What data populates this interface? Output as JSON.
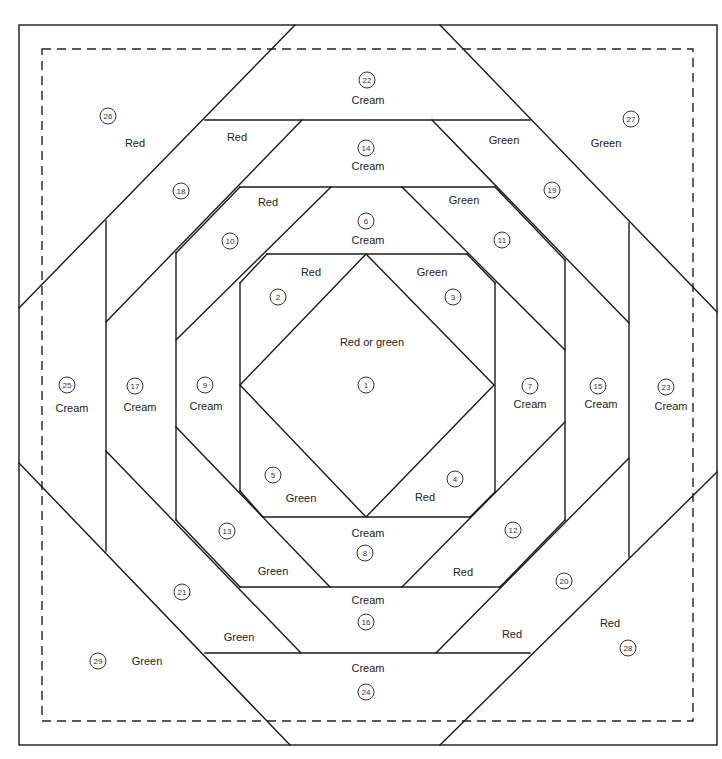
{
  "diagram": {
    "pieces": [
      {
        "id": "1",
        "number": "1",
        "color": "Red or green",
        "num_xy": [
          366,
          385
        ],
        "lbl_xy": [
          372,
          342
        ]
      },
      {
        "id": "2",
        "number": "2",
        "color": "Red",
        "num_xy": [
          278,
          297
        ],
        "lbl_xy": [
          311,
          272
        ]
      },
      {
        "id": "3",
        "number": "3",
        "color": "Green",
        "num_xy": [
          453,
          297
        ],
        "lbl_xy": [
          432,
          272
        ]
      },
      {
        "id": "4",
        "number": "4",
        "color": "Red",
        "num_xy": [
          455,
          479
        ],
        "lbl_xy": [
          425,
          497
        ]
      },
      {
        "id": "5",
        "number": "5",
        "color": "Green",
        "num_xy": [
          273,
          475
        ],
        "lbl_xy": [
          301,
          498
        ]
      },
      {
        "id": "6",
        "number": "6",
        "color": "Cream",
        "num_xy": [
          366,
          221
        ],
        "lbl_xy": [
          368,
          240
        ]
      },
      {
        "id": "7",
        "number": "7",
        "color": "Cream",
        "num_xy": [
          530,
          386
        ],
        "lbl_xy": [
          530,
          404
        ]
      },
      {
        "id": "8",
        "number": "8",
        "color": "Cream",
        "num_xy": [
          365,
          553
        ],
        "lbl_xy": [
          368,
          533
        ]
      },
      {
        "id": "9",
        "number": "9",
        "color": "Cream",
        "num_xy": [
          205,
          385
        ],
        "lbl_xy": [
          206,
          406
        ]
      },
      {
        "id": "10",
        "number": "10",
        "color": "Red",
        "num_xy": [
          230,
          241
        ],
        "lbl_xy": [
          268,
          202
        ]
      },
      {
        "id": "11",
        "number": "11",
        "color": "Green",
        "num_xy": [
          502,
          240
        ],
        "lbl_xy": [
          464,
          200
        ]
      },
      {
        "id": "12",
        "number": "12",
        "color": "Red",
        "num_xy": [
          513,
          530
        ],
        "lbl_xy": [
          463,
          572
        ]
      },
      {
        "id": "13",
        "number": "13",
        "color": "Green",
        "num_xy": [
          227,
          531
        ],
        "lbl_xy": [
          273,
          571
        ]
      },
      {
        "id": "14",
        "number": "14",
        "color": "Cream",
        "num_xy": [
          366,
          148
        ],
        "lbl_xy": [
          368,
          166
        ]
      },
      {
        "id": "15",
        "number": "15",
        "color": "Cream",
        "num_xy": [
          598,
          386
        ],
        "lbl_xy": [
          601,
          404
        ]
      },
      {
        "id": "16",
        "number": "16",
        "color": "Cream",
        "num_xy": [
          366,
          622
        ],
        "lbl_xy": [
          368,
          600
        ]
      },
      {
        "id": "17",
        "number": "17",
        "color": "Cream",
        "num_xy": [
          135,
          386
        ],
        "lbl_xy": [
          140,
          407
        ]
      },
      {
        "id": "18",
        "number": "18",
        "color": "Red",
        "num_xy": [
          181,
          191
        ],
        "lbl_xy": [
          237,
          137
        ]
      },
      {
        "id": "19",
        "number": "19",
        "color": "Green",
        "num_xy": [
          552,
          190
        ],
        "lbl_xy": [
          504,
          140
        ]
      },
      {
        "id": "20",
        "number": "20",
        "color": "Red",
        "num_xy": [
          564,
          581
        ],
        "lbl_xy": [
          512,
          634
        ]
      },
      {
        "id": "21",
        "number": "21",
        "color": "Green",
        "num_xy": [
          182,
          592
        ],
        "lbl_xy": [
          239,
          637
        ]
      },
      {
        "id": "22",
        "number": "22",
        "color": "Cream",
        "num_xy": [
          367,
          80
        ],
        "lbl_xy": [
          368,
          100
        ]
      },
      {
        "id": "23",
        "number": "23",
        "color": "Cream",
        "num_xy": [
          666,
          387
        ],
        "lbl_xy": [
          671,
          406
        ]
      },
      {
        "id": "24",
        "number": "24",
        "color": "Cream",
        "num_xy": [
          366,
          692
        ],
        "lbl_xy": [
          368,
          668
        ]
      },
      {
        "id": "25",
        "number": "25",
        "color": "Cream",
        "num_xy": [
          67,
          385
        ],
        "lbl_xy": [
          72,
          408
        ]
      },
      {
        "id": "26",
        "number": "26",
        "color": "Red",
        "num_xy": [
          108,
          116
        ],
        "lbl_xy": [
          135,
          143
        ]
      },
      {
        "id": "27",
        "number": "27",
        "color": "Green",
        "num_xy": [
          631,
          119
        ],
        "lbl_xy": [
          606,
          143
        ]
      },
      {
        "id": "28",
        "number": "28",
        "color": "Red",
        "num_xy": [
          628,
          648
        ],
        "lbl_xy": [
          610,
          623
        ]
      },
      {
        "id": "29",
        "number": "29",
        "color": "Green",
        "num_xy": [
          98,
          661
        ],
        "lbl_xy": [
          147,
          661
        ]
      }
    ],
    "colors": {
      "line": "#1a1a1a",
      "background": "#ffffff"
    }
  }
}
